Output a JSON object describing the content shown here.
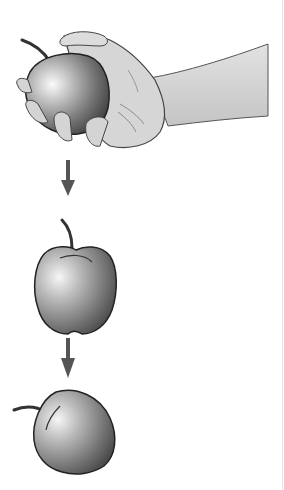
{
  "scene": {
    "description": "Three-step illustration of an apple being released from a hand and falling",
    "background": "#ffffff",
    "steps": [
      {
        "label": "apple-held-in-hand",
        "position": "top"
      },
      {
        "label": "apple-falling",
        "position": "middle"
      },
      {
        "label": "apple-landed-tilted",
        "position": "bottom"
      }
    ],
    "arrows": [
      {
        "direction": "down",
        "between": [
          "step-1",
          "step-2"
        ]
      },
      {
        "direction": "down",
        "between": [
          "step-2",
          "step-3"
        ]
      }
    ],
    "colors": {
      "arrow": "#555555",
      "outline": "#222222",
      "apple_light": "#f4f4f4",
      "apple_dark": "#4a4a4a",
      "skin": "#d8d8d8",
      "skin_shadow": "#a8a8a8"
    }
  }
}
